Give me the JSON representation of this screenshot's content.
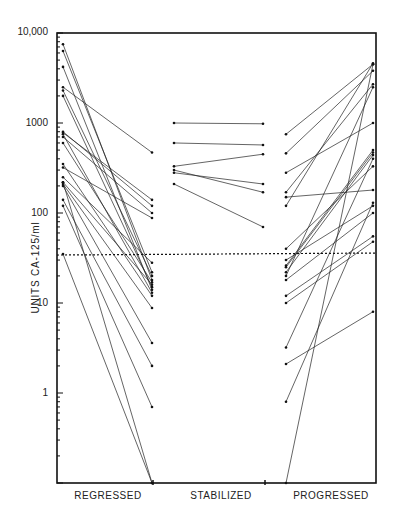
{
  "chart_data": {
    "type": "line",
    "title": "",
    "xlabel": "",
    "ylabel": "UNITS CA-125/ml",
    "yscale": "log",
    "ylim": [
      0.1,
      10000
    ],
    "y_ticks": [
      "10,000",
      "1000",
      "100",
      "10",
      "1"
    ],
    "categories": [
      "REGRESSED",
      "STABILIZED",
      "PROGRESSED"
    ],
    "reference_line": {
      "value": 35,
      "style": "dotted"
    },
    "grid": false,
    "legend": null,
    "groups": [
      {
        "name": "REGRESSED",
        "pairs": [
          [
            7500,
            18
          ],
          [
            6300,
            22
          ],
          [
            4200,
            14
          ],
          [
            2500,
            470
          ],
          [
            2300,
            20
          ],
          [
            2000,
            15
          ],
          [
            800,
            120
          ],
          [
            780,
            140
          ],
          [
            750,
            13
          ],
          [
            700,
            100
          ],
          [
            600,
            17
          ],
          [
            350,
            12
          ],
          [
            320,
            88
          ],
          [
            250,
            28
          ],
          [
            220,
            16
          ],
          [
            210,
            8.8
          ],
          [
            200,
            3.6
          ],
          [
            140,
            2.0
          ],
          [
            120,
            0.7
          ],
          [
            35,
            0.1
          ],
          [
            220,
            0.1
          ]
        ]
      },
      {
        "name": "STABILIZED",
        "pairs": [
          [
            1000,
            980
          ],
          [
            600,
            570
          ],
          [
            330,
            450
          ],
          [
            300,
            170
          ],
          [
            280,
            210
          ],
          [
            210,
            70
          ]
        ]
      },
      {
        "name": "PROGRESSED",
        "pairs": [
          [
            750,
            4500
          ],
          [
            460,
            3800
          ],
          [
            280,
            1000
          ],
          [
            170,
            2700
          ],
          [
            150,
            180
          ],
          [
            120,
            4600
          ],
          [
            40,
            330
          ],
          [
            30,
            120
          ],
          [
            26,
            500
          ],
          [
            25,
            470
          ],
          [
            22,
            440
          ],
          [
            20,
            2500
          ],
          [
            18,
            100
          ],
          [
            12,
            55
          ],
          [
            10,
            48
          ],
          [
            3.2,
            400
          ],
          [
            2.1,
            8
          ],
          [
            0.8,
            130
          ],
          [
            0.1,
            4500
          ]
        ]
      }
    ]
  }
}
